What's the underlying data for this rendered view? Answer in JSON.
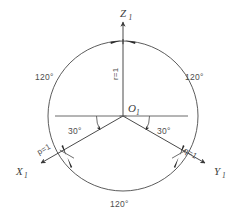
{
  "diagram": {
    "colors": {
      "stroke": "#4a4a4a",
      "text": "#3d3d3d",
      "dimension_text": "#4d4d4d",
      "background": "#ffffff"
    },
    "axes": [
      {
        "id": "z",
        "label": "Z",
        "subscript": "1",
        "direction_deg": 90,
        "coefficient": "r=1"
      },
      {
        "id": "x",
        "label": "X",
        "subscript": "1",
        "direction_deg": 210,
        "coefficient": "p=1"
      },
      {
        "id": "y",
        "label": "Y",
        "subscript": "1",
        "direction_deg": 330,
        "coefficient": "q=1"
      }
    ],
    "origin": {
      "label": "O",
      "subscript": "1",
      "x": 123,
      "y": 116
    },
    "circle": {
      "center_x": 123,
      "center_y": 116,
      "radius": 75
    },
    "angles_between_axes": [
      {
        "id": "angle-z-x",
        "value": "120°",
        "position": "upper-left"
      },
      {
        "id": "angle-z-y",
        "value": "120°",
        "position": "upper-right"
      },
      {
        "id": "angle-x-y",
        "value": "120°",
        "position": "bottom"
      }
    ],
    "angles_to_horizontal": [
      {
        "id": "angle-horizontal-x",
        "value": "30°",
        "position": "left"
      },
      {
        "id": "angle-horizontal-y",
        "value": "30°",
        "position": "right"
      }
    ],
    "labels": {
      "z_axis": "Z",
      "z_axis_sub": "1",
      "x_axis": "X",
      "x_axis_sub": "1",
      "y_axis": "Y",
      "y_axis_sub": "1",
      "origin": "O",
      "origin_sub": "1",
      "r_coefficient": "r=1",
      "p_coefficient": "p=1",
      "q_coefficient": "q=1",
      "angle_120_left": "120°",
      "angle_120_right": "120°",
      "angle_120_bottom": "120°",
      "angle_30_left": "30°",
      "angle_30_right": "30°"
    }
  }
}
